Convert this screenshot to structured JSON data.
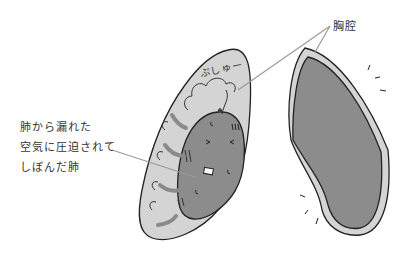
{
  "diagram": {
    "title": "",
    "labels": {
      "thoracic_cavity": "胸腔",
      "collapsed_lung_lines": [
        "肺から漏れた",
        "空気に圧迫されて",
        "しぼんだ肺"
      ],
      "sound_effect": "ぷしゅー"
    },
    "elements": [
      {
        "name": "left-thorax-with-pneumothorax",
        "description": "Left thoracic cavity filled with leaked air (light gray) compressing a collapsed lung (dark gray) with a distressed face"
      },
      {
        "name": "right-thorax-normal-lung",
        "description": "Right thoracic cavity with normal expanded lung (dark gray) within light gray pleural border"
      }
    ],
    "colors": {
      "cavity_fill": "#d4d4d4",
      "lung_fill": "#8c8c8c",
      "outline": "#222222",
      "air_arrow": "#8a8a8a",
      "leader_line": "#9a9a9a"
    }
  }
}
